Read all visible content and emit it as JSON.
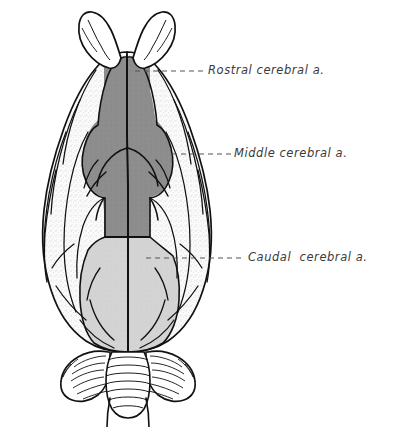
{
  "figure": {
    "view": "dorsal",
    "labels": [
      {
        "id": "rostral",
        "text": "Rostral cerebral a.",
        "leader": {
          "x1": 135,
          "y1": 71,
          "x2": 205,
          "y2": 71
        },
        "region_shade": "dark-gray",
        "region_color": "#8d8d8d"
      },
      {
        "id": "middle",
        "text": "Middle cerebral a.",
        "leader": {
          "x1": 172,
          "y1": 154,
          "x2": 231,
          "y2": 154
        },
        "region_shade": "dark-gray",
        "region_color": "#8d8d8d"
      },
      {
        "id": "caudal",
        "text": "Caudal  cerebral a.",
        "leader": {
          "x1": 146,
          "y1": 258,
          "x2": 245,
          "y2": 258
        },
        "region_shade": "light-gray",
        "region_color": "#d4d4d4"
      }
    ],
    "structures": [
      {
        "name": "olfactory-bulb-left",
        "shade": "white"
      },
      {
        "name": "olfactory-bulb-right",
        "shade": "white"
      },
      {
        "name": "cerebral-hemisphere-left",
        "shade": "stipple-white"
      },
      {
        "name": "cerebral-hemisphere-right",
        "shade": "stipple-white"
      },
      {
        "name": "rostral-middle-territory",
        "shade": "dark-gray"
      },
      {
        "name": "caudal-territory",
        "shade": "light-gray"
      },
      {
        "name": "cerebellar-vermis",
        "shade": "white"
      },
      {
        "name": "cerebellar-hemisphere-left",
        "shade": "white"
      },
      {
        "name": "cerebellar-hemisphere-right",
        "shade": "white"
      },
      {
        "name": "brainstem-medulla",
        "shade": "white"
      }
    ],
    "colors": {
      "outline": "#111111",
      "dark_gray": "#8d8d8d",
      "light_gray": "#d4d4d4",
      "stipple_base": "#fbfbfb",
      "leader": "#555555",
      "text": "#3a3a3a",
      "background": "#ffffff"
    }
  }
}
